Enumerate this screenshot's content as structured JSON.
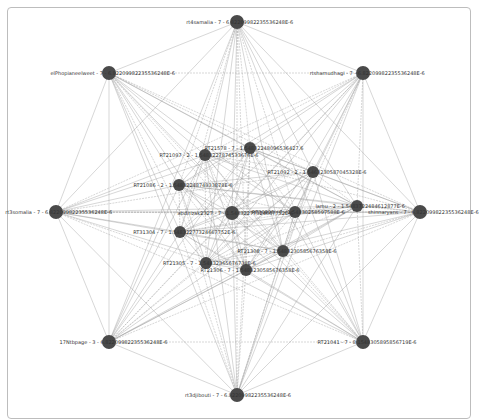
{
  "graph": {
    "nodes": [
      {
        "id": "n0",
        "label": "rt4samalia - 7 - 6.82209982235536248E-6",
        "x": 237,
        "y": 22,
        "r": 7
      },
      {
        "id": "n1",
        "label": "elPhopianeelweet - 7 - 6.82209982235536248E-6",
        "x": 109,
        "y": 73,
        "r": 7
      },
      {
        "id": "n2",
        "label": "rtshamudhagi - 7 - 6.82209982235536248E-6",
        "x": 363,
        "y": 73,
        "r": 7
      },
      {
        "id": "n3",
        "label": "RT21578 - 7 - 1.54832248096536427.6",
        "x": 250,
        "y": 148,
        "r": 6
      },
      {
        "id": "n4",
        "label": "RT21097 - 2 - 1.5483227874533676E-6",
        "x": 205,
        "y": 155,
        "r": 6
      },
      {
        "id": "n5",
        "label": "RT21092 - 2 - 1.5463230587045328E-6",
        "x": 313,
        "y": 172,
        "r": 6
      },
      {
        "id": "n6",
        "label": "RT21086 - 2 - 1.5483224874933878E-6",
        "x": 179,
        "y": 185,
        "r": 6
      },
      {
        "id": "n7",
        "label": "rt3somalia - 7 - 6.82209982235536248E-6",
        "x": 56,
        "y": 212,
        "r": 7
      },
      {
        "id": "n8",
        "label": "abdirizak2327 - 7 - 1.54832277324667752E-6",
        "x": 232,
        "y": 213,
        "r": 7
      },
      {
        "id": "n9",
        "label": "RT30806 - 7 - 1.54830258597588E-6",
        "x": 295,
        "y": 212,
        "r": 6
      },
      {
        "id": "n10",
        "label": "lamu - 2 - 1.5483722484612877E-6",
        "x": 357,
        "y": 206,
        "r": 6
      },
      {
        "id": "n11",
        "label": "shinnaryans - 7 - 6.82209982235536248E-6",
        "x": 420,
        "y": 212,
        "r": 7
      },
      {
        "id": "n12",
        "label": "RT31304 - 7 - 1.54832277324667752E-6",
        "x": 180,
        "y": 232,
        "r": 6
      },
      {
        "id": "n13",
        "label": "RT21308 - 7 - 1.5483230585676358E-6",
        "x": 283,
        "y": 251,
        "r": 6
      },
      {
        "id": "n14",
        "label": "RT21305 - 7 - 1.54832365676738E-6",
        "x": 206,
        "y": 263,
        "r": 6
      },
      {
        "id": "n15",
        "label": "RT21306 - 7 - 1.5483230585676358E-6",
        "x": 246,
        "y": 270,
        "r": 6
      },
      {
        "id": "n16",
        "label": "17Ntbpage - 3 - 6.82209982235536248E-6",
        "x": 109,
        "y": 342,
        "r": 7
      },
      {
        "id": "n17",
        "label": "RT21041 - 7 - 8.1548305895856719E-6",
        "x": 363,
        "y": 342,
        "r": 7
      },
      {
        "id": "n18",
        "label": "rt3djibouti - 7 - 6.82209982235536248E-6",
        "x": 237,
        "y": 395,
        "r": 7
      }
    ],
    "colors": {
      "node": "#4a4a4a",
      "edge": "#9a9a9a",
      "label": "#333333",
      "frame": "#bdbdbd"
    }
  }
}
